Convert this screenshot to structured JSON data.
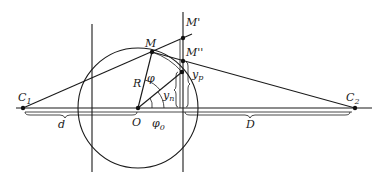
{
  "diagram": {
    "title": "",
    "labels": {
      "C1": "C",
      "C1_sub": "1",
      "C2": "C",
      "C2_sub": "2",
      "O": "O",
      "M": "M",
      "M_prime": "M'",
      "M_dprime": "M''",
      "R": "R",
      "phi": "φ",
      "phi0": "φ",
      "phi0_sub": "0",
      "yn": "y",
      "yn_sub": "n",
      "yp": "y",
      "yp_sub": "p",
      "d": "d",
      "D": "D"
    },
    "elements": [
      "horizontal-axis",
      "circle",
      "vertical-line-left",
      "vertical-line-right",
      "line-C1-to-M-prime",
      "line-M-to-C2",
      "radius-OM",
      "line-O-to-P",
      "angle-arc-phi",
      "angle-arc-phi0",
      "brace-d",
      "brace-D",
      "brace-yp",
      "brace-yn"
    ]
  }
}
